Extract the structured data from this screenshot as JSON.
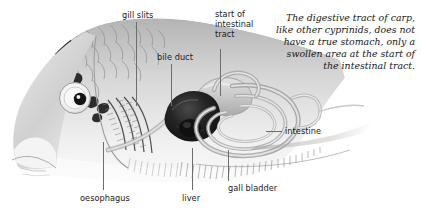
{
  "figure": {
    "caption": "The digestive tract of carp, like other cyprinids, does not have a true stomach, only a swollen area at the start of the intestinal tract.",
    "colors": {
      "background": "#ffffff",
      "leader_line": "#6d6d6d",
      "label_text": "#1a1a1a",
      "caption_text": "#161616",
      "illustration_dark": "#1c1c1c",
      "illustration_mid": "#8d8d8d",
      "illustration_light": "#d9d9d9"
    }
  },
  "labels": {
    "gill_slits": "gill slits",
    "start_of_intestinal_tract": "start of\nintestinal\ntract",
    "start_of_intestinal_tract_lines": [
      "start of",
      "intestinal",
      "tract"
    ],
    "bile_duct": "bile duct",
    "intestine": "intestine",
    "oesophagus": "oesophagus",
    "liver": "liver",
    "gall_bladder": "gall bladder"
  }
}
